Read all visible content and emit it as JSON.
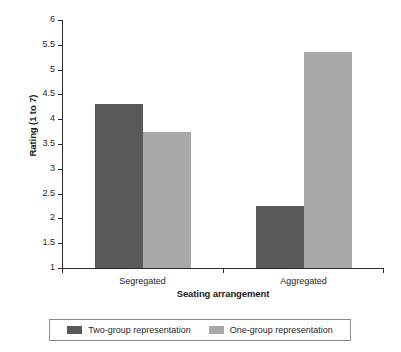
{
  "chart_data": {
    "type": "bar",
    "title": "",
    "xlabel": "Seating arrangement",
    "ylabel": "Rating (1 to 7)",
    "categories": [
      "Segregated",
      "Aggregated"
    ],
    "series": [
      {
        "name": "Two-group representation",
        "color": "#595959",
        "values": [
          4.3,
          2.25
        ]
      },
      {
        "name": "One-group representation",
        "color": "#a9a9a9",
        "values": [
          3.75,
          5.35
        ]
      }
    ],
    "ylim": [
      1,
      6
    ],
    "ytick_step": 0.5,
    "yticks": [
      "6",
      "5.5",
      "5",
      "4.5",
      "4",
      "3.5",
      "3",
      "2.5",
      "2",
      "1.5",
      "1"
    ],
    "grid": false,
    "legend_position": "bottom"
  },
  "axis": {
    "y_title": "Rating (1 to 7)",
    "x_title": "Seating arrangement"
  },
  "legend": {
    "items": [
      {
        "label": "Two-group representation",
        "color": "#595959"
      },
      {
        "label": "One-group representation",
        "color": "#a9a9a9"
      }
    ]
  }
}
